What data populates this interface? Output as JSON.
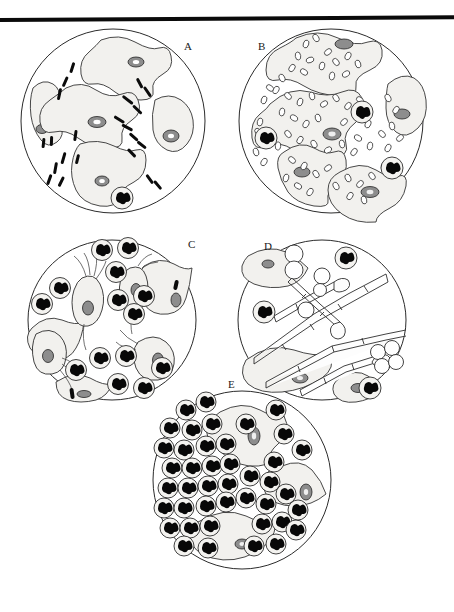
{
  "figure": {
    "panel_count": 5,
    "background_color": "#ffffff",
    "ink_color": "#1a1a1a",
    "top_rule": {
      "present": true,
      "color": "#0a0a0a",
      "thickness_px": 4
    }
  },
  "panels": [
    {
      "id": "A",
      "label": "A",
      "field_shape": "circle",
      "caption_visible": false,
      "contents": {
        "epithelial_cells": 5,
        "epithelial_cell_description": "large squamous epithelial cells with smooth distinct borders and small central nuclei",
        "bacteria_morphology": "large rods (lactobacilli)",
        "bacteria_count_approx": 22,
        "coccobacilli": 0,
        "neutrophils": 1,
        "yeast": 0,
        "protozoa": 0
      }
    },
    {
      "id": "B",
      "label": "B",
      "field_shape": "circle",
      "caption_visible": false,
      "contents": {
        "epithelial_cells": 6,
        "epithelial_cell_description": "clue cells - squamous epithelial cells studded with adherent coccobacilli obscuring cell borders",
        "bacteria_morphology": "coccobacilli",
        "bacteria_count_approx": 120,
        "coccobacilli": 120,
        "neutrophils": 3,
        "yeast": 0,
        "protozoa": 0
      }
    },
    {
      "id": "C",
      "label": "C",
      "field_shape": "circle",
      "caption_visible": false,
      "contents": {
        "epithelial_cells": 1,
        "epithelial_cell_description": "few epithelial cells",
        "bacteria_morphology": "rare rods",
        "bacteria_count_approx": 2,
        "coccobacilli": 0,
        "neutrophils": 18,
        "yeast": 0,
        "protozoa": 5,
        "protozoa_description": "pear-shaped flagellated trichomonads with anterior flagella and undulating membrane"
      }
    },
    {
      "id": "D",
      "label": "D",
      "field_shape": "circle",
      "caption_visible": false,
      "contents": {
        "epithelial_cells": 3,
        "epithelial_cell_description": "squamous epithelial cells in background",
        "bacteria_morphology": "none prominent",
        "bacteria_count_approx": 0,
        "coccobacilli": 0,
        "neutrophils": 3,
        "yeast": 9,
        "yeast_description": "budding yeast cells and branching septate pseudohyphae",
        "pseudohyphae": 7,
        "protozoa": 0
      }
    },
    {
      "id": "E",
      "label": "E",
      "field_shape": "circle",
      "caption_visible": false,
      "contents": {
        "epithelial_cells": 4,
        "epithelial_cell_description": "squamous epithelial cells partly obscured by inflammatory cells",
        "bacteria_morphology": "none prominent",
        "bacteria_count_approx": 0,
        "coccobacilli": 0,
        "neutrophils": 42,
        "neutrophil_description": "abundant polymorphonuclear leukocytes with multilobed nuclei",
        "yeast": 0,
        "protozoa": 0
      }
    }
  ]
}
